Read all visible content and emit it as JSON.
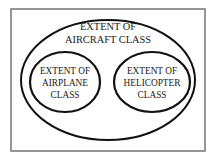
{
  "diagram": {
    "type": "euler-set-diagram",
    "title": "Extent of Aircraft Class",
    "canvas": {
      "width": 217,
      "height": 161,
      "background_color": "#ffffff"
    },
    "frame": {
      "name": "border-rectangle",
      "stroke_color": "#6a6a6a",
      "x": 11,
      "y": 9,
      "width": 194,
      "height": 142
    },
    "sets": [
      {
        "id": "aircraft",
        "shape": "ellipse",
        "role": "superset",
        "stroke_color": "#111111",
        "cx": 108,
        "cy": 80,
        "rx": 87,
        "ry": 60,
        "label_lines": [
          "EXTENT OF",
          "AIRCRAFT CLASS"
        ],
        "line1": "EXTENT OF",
        "line2": "AIRCRAFT CLASS",
        "label_x": 108,
        "label_y": 33
      },
      {
        "id": "airplane",
        "shape": "ellipse",
        "role": "subset",
        "stroke_color": "#111111",
        "cx": 65,
        "cy": 82,
        "rx": 35,
        "ry": 30,
        "label_lines": [
          "EXTENT OF",
          "AIRPLANE",
          "CLASS"
        ],
        "line1": "EXTENT OF",
        "line2": "AIRPLANE",
        "line3": "CLASS",
        "label_x": 65,
        "label_y": 82
      },
      {
        "id": "helicopter",
        "shape": "ellipse",
        "role": "subset",
        "stroke_color": "#111111",
        "cx": 152,
        "cy": 82,
        "rx": 38,
        "ry": 30,
        "label_lines": [
          "EXTENT OF",
          "HELICOPTER",
          "CLASS"
        ],
        "line1": "EXTENT OF",
        "line2": "HELICOPTER",
        "line3": "CLASS",
        "label_x": 152,
        "label_y": 82
      }
    ]
  }
}
